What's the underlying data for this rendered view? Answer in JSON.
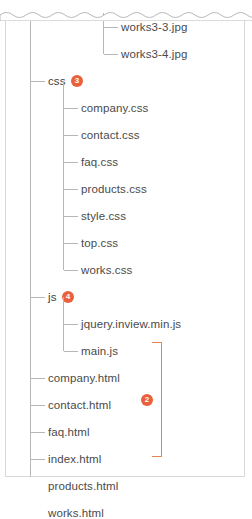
{
  "panel": {
    "title": "directory-tree",
    "torn_top_edge": true,
    "border_color": "#d8d8d8"
  },
  "colors": {
    "badge": "#e8613c",
    "bracket": "#e8834f",
    "tree_line": "#b7b7b7",
    "text": "#4a4a4a",
    "background": "#ffffff"
  },
  "tree": {
    "nodes": [
      {
        "id": "works3-3",
        "label": "works3-3.jpg",
        "depth": 3,
        "type": "file"
      },
      {
        "id": "works3-4",
        "label": "works3-4.jpg",
        "depth": 3,
        "type": "file"
      },
      {
        "id": "css",
        "label": "css",
        "depth": 1,
        "type": "folder",
        "badge": "3"
      },
      {
        "id": "company-css",
        "label": "company.css",
        "depth": 2,
        "type": "file"
      },
      {
        "id": "contact-css",
        "label": "contact.css",
        "depth": 2,
        "type": "file"
      },
      {
        "id": "faq-css",
        "label": "faq.css",
        "depth": 2,
        "type": "file"
      },
      {
        "id": "products-css",
        "label": "products.css",
        "depth": 2,
        "type": "file"
      },
      {
        "id": "style-css",
        "label": "style.css",
        "depth": 2,
        "type": "file"
      },
      {
        "id": "top-css",
        "label": "top.css",
        "depth": 2,
        "type": "file"
      },
      {
        "id": "works-css",
        "label": "works.css",
        "depth": 2,
        "type": "file"
      },
      {
        "id": "js",
        "label": "js",
        "depth": 1,
        "type": "folder",
        "badge": "4"
      },
      {
        "id": "jquery-inview",
        "label": "jquery.inview.min.js",
        "depth": 2,
        "type": "file"
      },
      {
        "id": "main-js",
        "label": "main.js",
        "depth": 2,
        "type": "file"
      },
      {
        "id": "company-html",
        "label": "company.html",
        "depth": 1,
        "type": "file"
      },
      {
        "id": "contact-html",
        "label": "contact.html",
        "depth": 1,
        "type": "file"
      },
      {
        "id": "faq-html",
        "label": "faq.html",
        "depth": 1,
        "type": "file"
      },
      {
        "id": "index-html",
        "label": "index.html",
        "depth": 1,
        "type": "file"
      },
      {
        "id": "products-html",
        "label": "products.html",
        "depth": 1,
        "type": "file"
      },
      {
        "id": "works-html",
        "label": "works.html",
        "depth": 1,
        "type": "file"
      }
    ],
    "annotations": [
      {
        "id": "badge-css",
        "label": "3",
        "target": "css"
      },
      {
        "id": "badge-js",
        "label": "4",
        "target": "js"
      },
      {
        "id": "badge-html-group",
        "label": "2",
        "target": "html-file-group"
      }
    ]
  }
}
